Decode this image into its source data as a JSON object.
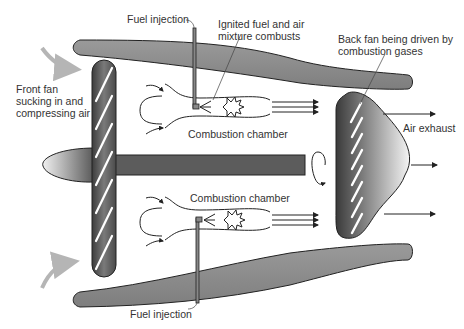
{
  "diagram": {
    "labels": {
      "fuel_injection_top": "Fuel injection",
      "ignited_line1": "Ignited fuel and air",
      "ignited_line2": "mixture combusts",
      "back_fan_line1": "Back fan being driven by",
      "back_fan_line2": "combustion gases",
      "front_fan_line1": "Front fan",
      "front_fan_line2": "sucking in and",
      "front_fan_line3": "compressing air",
      "combustion_chamber_top": "Combustion chamber",
      "combustion_chamber_bottom": "Combustion chamber",
      "air_exhaust": "Air exhaust",
      "fuel_injection_bottom": "Fuel injection"
    },
    "components": [
      "front-fan",
      "nose-cone",
      "drive-shaft",
      "upper-combustion-chamber",
      "lower-combustion-chamber",
      "back-fan",
      "upper-casing",
      "lower-casing"
    ],
    "colors": {
      "casing": "#8c8c8c",
      "shaft": "#5a5a5a",
      "fan_dark": "#3a3a3a",
      "intake_arrow": "#b5b5b5",
      "line": "#222222"
    }
  }
}
